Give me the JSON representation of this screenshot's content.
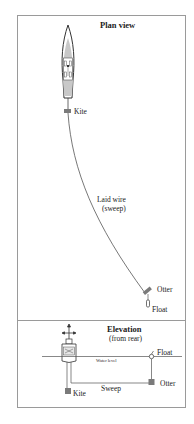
{
  "plan_view": {
    "title": "Plan view",
    "labels": {
      "kite": "Kite",
      "wire_line1": "Laid wire",
      "wire_line2": "(sweep)",
      "otter": "Otter",
      "float": "Float"
    }
  },
  "elevation_view": {
    "title": "Elevation",
    "subtitle": "(from rear)",
    "labels": {
      "water_level": "Water level",
      "float": "Float",
      "sweep": "Sweep",
      "otter": "Otter",
      "kite": "Kite"
    }
  },
  "colors": {
    "frame": "#9a9a9a",
    "hull_fill": "#c8c8c8",
    "device_fill": "#7a7a7a",
    "line": "#444444"
  }
}
